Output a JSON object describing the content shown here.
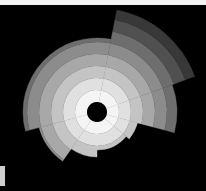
{
  "chart_data": {
    "type": "polar-area",
    "title": "",
    "center": [
      97,
      112
    ],
    "inner_radius": 10,
    "ring_step": 12,
    "ring_shades": [
      "#f4f4f4",
      "#e0e0e0",
      "#c4c4c4",
      "#a8a8a8",
      "#8c8c8c",
      "#6e6e6e",
      "#505050",
      "#383838"
    ],
    "sectors": [
      {
        "start_deg": -79,
        "end_deg": -20,
        "radius": 104
      },
      {
        "start_deg": -20,
        "end_deg": 15,
        "radius": 80
      },
      {
        "start_deg": 15,
        "end_deg": 40,
        "radius": 42
      },
      {
        "start_deg": 40,
        "end_deg": 90,
        "radius": 38
      },
      {
        "start_deg": 90,
        "end_deg": 125,
        "radius": 45
      },
      {
        "start_deg": 125,
        "end_deg": 165,
        "radius": 60
      },
      {
        "start_deg": 165,
        "end_deg": 281,
        "radius": 74
      }
    ]
  }
}
